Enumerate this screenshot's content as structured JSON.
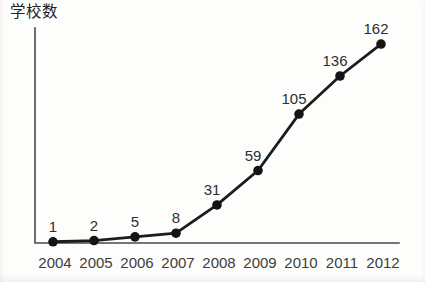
{
  "chart_data": {
    "type": "line",
    "title": "",
    "ylabel": "学校数",
    "xlabel": "",
    "categories": [
      "2004",
      "2005",
      "2006",
      "2007",
      "2008",
      "2009",
      "2010",
      "2011",
      "2012"
    ],
    "series": [
      {
        "name": "学校数",
        "values": [
          1,
          2,
          5,
          8,
          31,
          59,
          105,
          136,
          162
        ]
      }
    ],
    "value_labels_shown": true,
    "ylim": [
      0,
      175
    ],
    "grid": false,
    "legend": "none",
    "line_color": "#1c1c1c",
    "marker_color": "#141414",
    "axis_color": "#4a4a4a",
    "background_color": "#fdfdfc"
  }
}
